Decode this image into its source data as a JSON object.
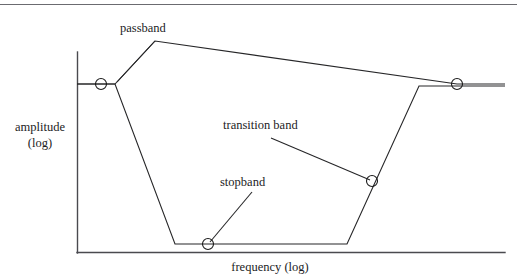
{
  "figure": {
    "axes": {
      "y_label_line1": "amplitude",
      "y_label_line2": "(log)",
      "x_label": "frequency (log)"
    },
    "annotations": {
      "passband": "passband",
      "transition_band": "transition band",
      "stopband": "stopband"
    },
    "colors": {
      "ink": "#262628",
      "axis": "#4a4a4f",
      "rule": "#6b6b70",
      "background": "#ffffff"
    }
  },
  "chart_data": {
    "type": "line",
    "title": "",
    "xlabel": "frequency (log)",
    "ylabel": "amplitude (log)",
    "grid": false,
    "legend": "none",
    "axis_origin_px": [
      77,
      253
    ],
    "axis_top_px": [
      77,
      52
    ],
    "axis_right_px": [
      505,
      253
    ],
    "annotations": [
      {
        "text": "passband",
        "text_pos_px": [
          120,
          20
        ],
        "leader_from_px": [
          155,
          41
        ],
        "leader_to_px": [
          117,
          82
        ]
      },
      {
        "text": "transition band",
        "text_pos_px": [
          223,
          117
        ],
        "leader_from_px": [
          271,
          138
        ],
        "leader_to_px": [
          370,
          180
        ]
      },
      {
        "text": "stopband",
        "text_pos_px": [
          220,
          174
        ],
        "leader_from_px": [
          252,
          192
        ],
        "leader_to_px": [
          210,
          242
        ]
      }
    ],
    "series": [
      {
        "name": "upper bound",
        "comment": "upper tolerance envelope of the filter magnitude spec",
        "points_px": [
          [
            77,
            84
          ],
          [
            115,
            84
          ],
          [
            155,
            41
          ],
          [
            457,
            84
          ],
          [
            505,
            84
          ]
        ]
      },
      {
        "name": "lower bound",
        "comment": "lower tolerance envelope: passband ripple floor, stopband floor, and the rising transition edge",
        "points_px": [
          [
            77,
            84
          ],
          [
            115,
            84
          ],
          [
            175,
            244
          ],
          [
            347,
            244
          ],
          [
            419,
            86
          ],
          [
            505,
            86
          ]
        ]
      }
    ],
    "markers": [
      {
        "name": "passband-edge-marker",
        "pos_px": [
          101,
          84
        ],
        "r": 5.5
      },
      {
        "name": "stopband-marker",
        "pos_px": [
          208,
          244
        ],
        "r": 5.5
      },
      {
        "name": "transition-band-marker",
        "pos_px": [
          372,
          181
        ],
        "r": 5.5
      },
      {
        "name": "passband-right-marker",
        "pos_px": [
          457,
          84
        ],
        "r": 5.5
      }
    ],
    "rules": [
      {
        "name": "top-rule",
        "from_px": [
          0,
          4
        ],
        "to_px": [
          517,
          4
        ]
      }
    ]
  }
}
